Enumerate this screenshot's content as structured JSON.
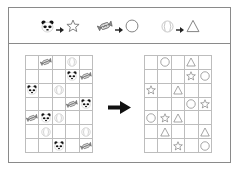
{
  "legend": [
    {
      "from": "panda",
      "to": "star"
    },
    {
      "from": "candy",
      "to": "circle"
    },
    {
      "from": "ball",
      "to": "triangle"
    }
  ],
  "icons": {
    "panda": "panda-icon",
    "candy": "candy-icon",
    "ball": "ball-icon",
    "star": "star-icon",
    "circle": "circle-icon",
    "triangle": "triangle-icon",
    "arrow": "right-arrow-icon"
  },
  "grid": {
    "rows": 7,
    "cols": 5
  },
  "left_grid": [
    [
      "",
      "candy",
      "",
      "ball",
      ""
    ],
    [
      "",
      "",
      "",
      "panda",
      "candy"
    ],
    [
      "panda",
      "",
      "ball",
      "",
      ""
    ],
    [
      "",
      "",
      "",
      "candy",
      "panda"
    ],
    [
      "candy",
      "panda",
      "ball",
      "",
      ""
    ],
    [
      "",
      "ball",
      "",
      "",
      "ball"
    ],
    [
      "",
      "",
      "panda",
      "",
      "candy"
    ]
  ],
  "right_grid": [
    [
      "",
      "circle",
      "",
      "triangle",
      ""
    ],
    [
      "",
      "",
      "",
      "star",
      "circle"
    ],
    [
      "star",
      "",
      "triangle",
      "",
      ""
    ],
    [
      "",
      "",
      "",
      "circle",
      "star"
    ],
    [
      "circle",
      "star",
      "triangle",
      "",
      ""
    ],
    [
      "",
      "triangle",
      "",
      "",
      "triangle"
    ],
    [
      "",
      "",
      "star",
      "",
      "circle"
    ]
  ],
  "colors": {
    "frame": "#8a8a8a",
    "grid_line": "#bdbdbd",
    "shape_stroke": "#777777",
    "arrow": "#111111"
  }
}
